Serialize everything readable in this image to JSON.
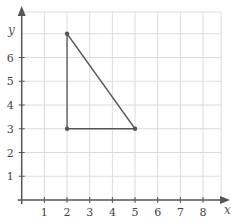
{
  "chart_data": {
    "type": "scatter",
    "title": "",
    "xlabel": "x",
    "ylabel": "y",
    "xlim": [
      0,
      8.8
    ],
    "ylim": [
      0,
      7.6
    ],
    "grid": true,
    "x_ticks": [
      1,
      2,
      3,
      4,
      5,
      6,
      7,
      8
    ],
    "y_ticks": [
      1,
      2,
      3,
      4,
      5,
      6
    ],
    "shape": "triangle",
    "points": [
      {
        "x": 2,
        "y": 7
      },
      {
        "x": 2,
        "y": 3
      },
      {
        "x": 5,
        "y": 3
      }
    ],
    "segments": [
      [
        {
          "x": 2,
          "y": 7
        },
        {
          "x": 2,
          "y": 3
        }
      ],
      [
        {
          "x": 2,
          "y": 3
        },
        {
          "x": 5,
          "y": 3
        }
      ],
      [
        {
          "x": 5,
          "y": 3
        },
        {
          "x": 2,
          "y": 7
        }
      ]
    ]
  },
  "colors": {
    "grid": "#dcdcdc",
    "axis": "#555555",
    "shape": "#555555"
  }
}
